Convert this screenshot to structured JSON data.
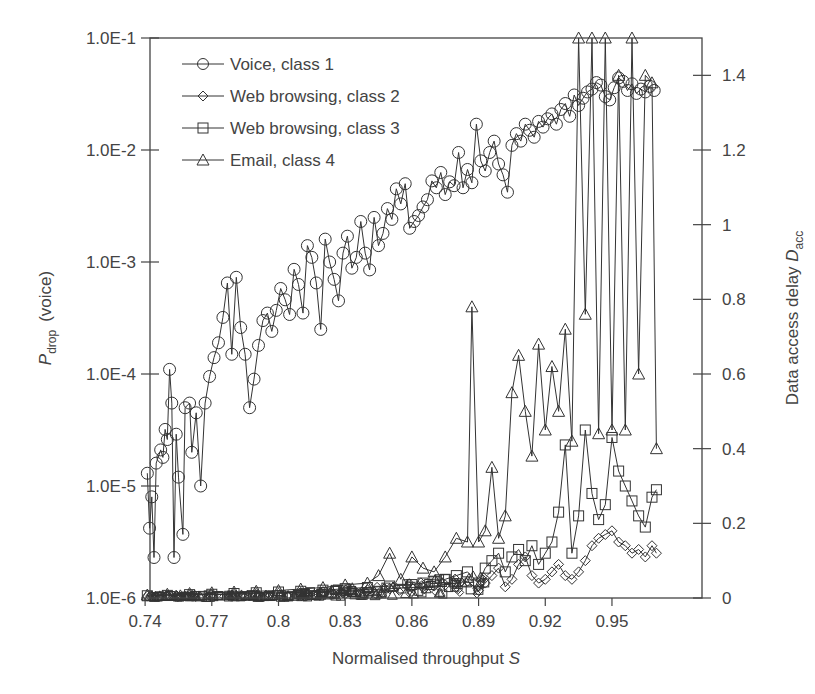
{
  "chart_data": {
    "type": "line",
    "title": "",
    "xlabel": "Normalised throughput S",
    "ylabel_left": "P_drop (voice)",
    "ylabel_left_main": "P",
    "ylabel_left_sub": "drop",
    "ylabel_left_suffix": "(voice)",
    "ylabel_right": "Data access delay D_acc",
    "ylabel_right_main": "Data access delay ",
    "ylabel_right_var": "D",
    "ylabel_right_sub": "acc",
    "xlim": [
      0.74,
      0.99
    ],
    "ylim_left": [
      1e-06,
      0.1
    ],
    "yscale_left": "log",
    "ylim_right": [
      0,
      1.5
    ],
    "yscale_right": "linear",
    "grid": false,
    "legend_position": "upper left",
    "x_ticks": [
      0.74,
      0.77,
      0.8,
      0.83,
      0.86,
      0.89,
      0.92,
      0.95
    ],
    "x_tick_labels": [
      "0.74",
      "0.77",
      "0.8",
      "0.83",
      "0.86",
      "0.89",
      "0.92",
      "0.95"
    ],
    "y_left_ticks": [
      0.1,
      0.01,
      0.001,
      0.0001,
      1e-05,
      1e-06
    ],
    "y_left_tick_labels": [
      "1.0E-1",
      "1.0E-2",
      "1.0E-3",
      "1.0E-4",
      "1.0E-5",
      "1.0E-6"
    ],
    "y_right_ticks": [
      1.4,
      1.2,
      1,
      0.8,
      0.6,
      0.4,
      0.2,
      0
    ],
    "y_right_tick_labels": [
      "1.4",
      "1.2",
      "1",
      "0.8",
      "0.6",
      "0.4",
      "0.2",
      "0"
    ],
    "series": [
      {
        "name": "Voice, class 1",
        "axis": "left",
        "marker": "circle",
        "x": [
          0.741,
          0.742,
          0.743,
          0.744,
          0.745,
          0.747,
          0.748,
          0.749,
          0.75,
          0.751,
          0.752,
          0.753,
          0.754,
          0.755,
          0.757,
          0.758,
          0.76,
          0.761,
          0.763,
          0.765,
          0.767,
          0.769,
          0.771,
          0.773,
          0.775,
          0.777,
          0.779,
          0.781,
          0.783,
          0.785,
          0.787,
          0.789,
          0.791,
          0.793,
          0.795,
          0.797,
          0.799,
          0.801,
          0.803,
          0.805,
          0.807,
          0.809,
          0.811,
          0.813,
          0.815,
          0.817,
          0.819,
          0.821,
          0.823,
          0.825,
          0.827,
          0.829,
          0.831,
          0.833,
          0.835,
          0.837,
          0.839,
          0.841,
          0.843,
          0.845,
          0.847,
          0.849,
          0.851,
          0.853,
          0.855,
          0.857,
          0.859,
          0.861,
          0.863,
          0.865,
          0.867,
          0.869,
          0.871,
          0.873,
          0.875,
          0.877,
          0.879,
          0.881,
          0.883,
          0.885,
          0.887,
          0.889,
          0.891,
          0.893,
          0.895,
          0.897,
          0.899,
          0.901,
          0.903,
          0.905,
          0.907,
          0.909,
          0.911,
          0.913,
          0.915,
          0.917,
          0.919,
          0.921,
          0.923,
          0.925,
          0.927,
          0.929,
          0.931,
          0.933,
          0.935,
          0.937,
          0.939,
          0.941,
          0.943,
          0.945,
          0.947,
          0.949,
          0.951,
          0.953,
          0.955,
          0.957,
          0.959,
          0.961,
          0.963,
          0.965,
          0.967,
          0.969
        ],
        "values": [
          1.3e-05,
          4.2e-06,
          8e-06,
          2.3e-06,
          1.6e-05,
          2.1e-05,
          1.8e-05,
          3.2e-05,
          2.6e-05,
          0.00011,
          5.5e-05,
          2.3e-06,
          2.9e-05,
          1.2e-05,
          3.7e-06,
          5e-05,
          5.5e-05,
          2e-05,
          4.5e-05,
          1e-05,
          5.5e-05,
          9.5e-05,
          0.00014,
          0.00019,
          0.00032,
          0.00065,
          0.00015,
          0.00073,
          0.00026,
          0.00015,
          5e-05,
          9e-05,
          0.00018,
          0.0003,
          0.00035,
          0.00024,
          0.00037,
          0.00058,
          0.00046,
          0.00034,
          0.00086,
          0.00063,
          0.00035,
          0.0014,
          0.0011,
          0.00065,
          0.00025,
          0.0016,
          0.001,
          0.0007,
          0.00045,
          0.0012,
          0.0017,
          0.00088,
          0.0011,
          0.0023,
          0.0012,
          0.00085,
          0.0025,
          0.0014,
          0.0018,
          0.003,
          0.0024,
          0.0045,
          0.0033,
          0.005,
          0.002,
          0.0023,
          0.0026,
          0.0031,
          0.0036,
          0.0053,
          0.0046,
          0.0063,
          0.004,
          0.0052,
          0.0048,
          0.0095,
          0.0046,
          0.0067,
          0.0051,
          0.017,
          0.008,
          0.0065,
          0.0095,
          0.012,
          0.0075,
          0.006,
          0.0042,
          0.011,
          0.014,
          0.012,
          0.017,
          0.015,
          0.013,
          0.018,
          0.016,
          0.019,
          0.021,
          0.017,
          0.023,
          0.026,
          0.02,
          0.031,
          0.025,
          0.029,
          0.033,
          0.035,
          0.04,
          0.038,
          0.03,
          0.028,
          0.036,
          0.044,
          0.041,
          0.034,
          0.039,
          0.032,
          0.035,
          0.033,
          0.037,
          0.034
        ]
      },
      {
        "name": "Web browsing, class 2",
        "axis": "right",
        "marker": "diamond",
        "x": [
          0.741,
          0.75,
          0.76,
          0.77,
          0.78,
          0.79,
          0.8,
          0.81,
          0.82,
          0.83,
          0.84,
          0.85,
          0.86,
          0.865,
          0.87,
          0.875,
          0.88,
          0.885,
          0.89,
          0.893,
          0.896,
          0.899,
          0.902,
          0.905,
          0.908,
          0.911,
          0.914,
          0.917,
          0.92,
          0.923,
          0.926,
          0.929,
          0.932,
          0.935,
          0.938,
          0.941,
          0.944,
          0.947,
          0.95,
          0.953,
          0.956,
          0.959,
          0.962,
          0.965,
          0.968,
          0.97
        ],
        "values": [
          0.005,
          0.006,
          0.008,
          0.009,
          0.01,
          0.012,
          0.013,
          0.015,
          0.017,
          0.02,
          0.022,
          0.025,
          0.028,
          0.03,
          0.032,
          0.035,
          0.04,
          0.045,
          0.02,
          0.04,
          0.06,
          0.08,
          0.03,
          0.05,
          0.09,
          0.11,
          0.06,
          0.04,
          0.05,
          0.07,
          0.09,
          0.06,
          0.05,
          0.07,
          0.1,
          0.14,
          0.16,
          0.17,
          0.18,
          0.15,
          0.14,
          0.12,
          0.13,
          0.11,
          0.14,
          0.12
        ]
      },
      {
        "name": "Web browsing, class 3",
        "axis": "right",
        "marker": "square",
        "x": [
          0.741,
          0.75,
          0.76,
          0.77,
          0.78,
          0.79,
          0.8,
          0.81,
          0.82,
          0.83,
          0.84,
          0.85,
          0.86,
          0.865,
          0.87,
          0.875,
          0.88,
          0.885,
          0.89,
          0.893,
          0.896,
          0.899,
          0.902,
          0.905,
          0.908,
          0.911,
          0.914,
          0.917,
          0.92,
          0.923,
          0.926,
          0.929,
          0.932,
          0.935,
          0.938,
          0.941,
          0.944,
          0.947,
          0.95,
          0.953,
          0.956,
          0.959,
          0.962,
          0.965,
          0.968,
          0.97
        ],
        "values": [
          0.006,
          0.007,
          0.009,
          0.01,
          0.012,
          0.014,
          0.016,
          0.018,
          0.021,
          0.025,
          0.028,
          0.032,
          0.036,
          0.04,
          0.045,
          0.05,
          0.06,
          0.07,
          0.04,
          0.08,
          0.1,
          0.12,
          0.07,
          0.11,
          0.13,
          0.1,
          0.14,
          0.09,
          0.12,
          0.15,
          0.23,
          0.41,
          0.12,
          0.22,
          0.45,
          0.28,
          0.21,
          0.25,
          0.43,
          0.34,
          0.3,
          0.26,
          0.22,
          0.19,
          0.27,
          0.29
        ]
      },
      {
        "name": "Email, class 4",
        "axis": "right",
        "marker": "triangle",
        "x": [
          0.741,
          0.75,
          0.76,
          0.77,
          0.78,
          0.79,
          0.8,
          0.81,
          0.82,
          0.83,
          0.84,
          0.845,
          0.85,
          0.855,
          0.86,
          0.865,
          0.87,
          0.875,
          0.88,
          0.885,
          0.887,
          0.89,
          0.893,
          0.896,
          0.899,
          0.902,
          0.905,
          0.908,
          0.911,
          0.914,
          0.917,
          0.92,
          0.923,
          0.926,
          0.929,
          0.932,
          0.935,
          0.938,
          0.941,
          0.944,
          0.947,
          0.95,
          0.953,
          0.956,
          0.959,
          0.962,
          0.965,
          0.968,
          0.97
        ],
        "values": [
          0.008,
          0.01,
          0.012,
          0.014,
          0.016,
          0.018,
          0.02,
          0.024,
          0.028,
          0.035,
          0.04,
          0.06,
          0.12,
          0.05,
          0.11,
          0.08,
          0.07,
          0.11,
          0.16,
          0.15,
          0.78,
          0.15,
          0.18,
          0.35,
          0.16,
          0.22,
          0.55,
          0.65,
          0.5,
          0.38,
          0.68,
          0.45,
          0.62,
          0.5,
          0.72,
          0.42,
          1.5,
          0.76,
          1.5,
          0.44,
          1.5,
          0.45,
          1.4,
          0.45,
          1.5,
          0.6,
          1.4,
          1.38,
          0.4
        ]
      }
    ]
  },
  "legend": {
    "items": [
      {
        "label": "Voice, class 1",
        "marker": "circle"
      },
      {
        "label": "Web browsing, class 2",
        "marker": "diamond"
      },
      {
        "label": "Web browsing, class 3",
        "marker": "square"
      },
      {
        "label": "Email, class 4",
        "marker": "triangle"
      }
    ]
  },
  "colors": {
    "line": "#333333",
    "axis": "#444444",
    "text": "#444444",
    "background": "#ffffff"
  }
}
